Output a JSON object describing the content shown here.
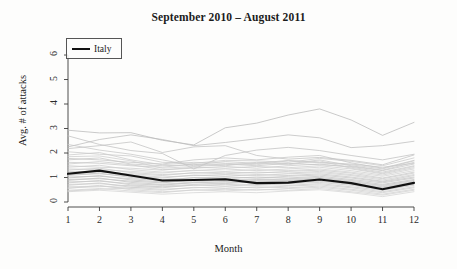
{
  "chart_data": {
    "type": "line",
    "title": "September 2010 – August 2011",
    "xlabel": "Month",
    "ylabel": "Avg. # of attacks",
    "x": [
      1,
      2,
      3,
      4,
      5,
      6,
      7,
      8,
      9,
      10,
      11,
      12
    ],
    "xticklabels": [
      "1",
      "2",
      "3",
      "4",
      "5",
      "6",
      "7",
      "8",
      "9",
      "10",
      "11",
      "12"
    ],
    "yticklabels": [
      "0",
      "1",
      "2",
      "3",
      "4",
      "5",
      "6"
    ],
    "yticks": [
      0,
      1,
      2,
      3,
      4,
      5,
      6
    ],
    "xlim": [
      1,
      12
    ],
    "ylim": [
      0,
      6.45
    ],
    "grid": false,
    "legend": {
      "position": "top-left",
      "entries": [
        {
          "label": "Italy",
          "color": "#111111",
          "linewidth": 2.2
        }
      ]
    },
    "highlight_color": "#111111",
    "background_color": "#fdfdfc",
    "series": [
      {
        "name": "Italy",
        "highlight": true,
        "color": "#111111",
        "values": [
          1.15,
          1.28,
          1.08,
          0.88,
          0.9,
          0.93,
          0.77,
          0.79,
          0.92,
          0.77,
          0.52,
          0.78
        ]
      },
      {
        "name": "country-01",
        "color": "#b8b8b8",
        "values": [
          2.93,
          2.82,
          2.83,
          2.52,
          2.33,
          3.03,
          3.22,
          3.55,
          3.8,
          3.35,
          2.72,
          3.25
        ]
      },
      {
        "name": "country-02",
        "color": "#bcbcbc",
        "values": [
          2.25,
          2.55,
          2.74,
          2.55,
          2.3,
          2.43,
          2.58,
          2.74,
          2.62,
          2.22,
          2.3,
          2.48
        ]
      },
      {
        "name": "country-03",
        "color": "#c0c0c0",
        "values": [
          2.7,
          2.35,
          2.1,
          1.98,
          1.35,
          1.9,
          2.12,
          2.23,
          2.1,
          1.9,
          1.72,
          1.95
        ]
      },
      {
        "name": "country-04",
        "color": "#c2c2c2",
        "values": [
          2.18,
          2.3,
          2.45,
          2.02,
          2.25,
          2.3,
          1.9,
          1.75,
          1.82,
          1.7,
          1.52,
          1.92
        ]
      },
      {
        "name": "country-05",
        "color": "#c4c4c4",
        "values": [
          1.78,
          1.72,
          1.62,
          1.55,
          1.72,
          1.8,
          1.72,
          1.83,
          1.9,
          1.6,
          1.38,
          1.7
        ]
      },
      {
        "name": "country-06",
        "color": "#c6c6c6",
        "values": [
          1.72,
          1.8,
          1.55,
          1.48,
          1.52,
          1.65,
          1.58,
          1.7,
          1.62,
          1.55,
          1.42,
          1.58
        ]
      },
      {
        "name": "country-07",
        "color": "#c8c8c8",
        "values": [
          1.62,
          1.58,
          1.48,
          1.42,
          1.55,
          1.48,
          1.62,
          1.55,
          1.72,
          1.48,
          1.3,
          1.62
        ]
      },
      {
        "name": "country-08",
        "color": "#cacaca",
        "values": [
          1.55,
          1.65,
          1.52,
          1.32,
          1.38,
          1.45,
          1.38,
          1.48,
          1.55,
          1.42,
          1.22,
          1.48
        ]
      },
      {
        "name": "country-09",
        "color": "#cccccc",
        "values": [
          1.48,
          1.42,
          1.38,
          1.3,
          1.42,
          1.38,
          1.45,
          1.4,
          1.48,
          1.35,
          1.15,
          1.4
        ]
      },
      {
        "name": "country-10",
        "color": "#cecece",
        "values": [
          1.42,
          1.5,
          1.32,
          1.22,
          1.28,
          1.35,
          1.28,
          1.35,
          1.42,
          1.28,
          1.1,
          1.35
        ]
      },
      {
        "name": "country-11",
        "color": "#d0d0d0",
        "values": [
          1.35,
          1.32,
          1.25,
          1.18,
          1.3,
          1.25,
          1.32,
          1.28,
          1.35,
          1.22,
          1.05,
          1.28
        ]
      },
      {
        "name": "country-12",
        "color": "#c9c9c9",
        "values": [
          1.3,
          1.38,
          1.2,
          1.12,
          1.18,
          1.22,
          1.18,
          1.25,
          1.3,
          1.18,
          0.98,
          1.22
        ]
      },
      {
        "name": "country-13",
        "color": "#cbcbcb",
        "values": [
          1.25,
          1.22,
          1.15,
          1.08,
          1.2,
          1.15,
          1.22,
          1.18,
          1.25,
          1.12,
          0.95,
          1.18
        ]
      },
      {
        "name": "country-14",
        "color": "#cdcdcd",
        "values": [
          1.18,
          1.28,
          1.1,
          1.02,
          1.08,
          1.12,
          1.08,
          1.15,
          1.2,
          1.08,
          0.9,
          1.12
        ]
      },
      {
        "name": "country-15",
        "color": "#c7c7c7",
        "values": [
          1.12,
          1.15,
          1.05,
          0.98,
          1.1,
          1.05,
          1.12,
          1.08,
          1.15,
          1.02,
          0.85,
          1.08
        ]
      },
      {
        "name": "country-16",
        "color": "#c5c5c5",
        "values": [
          1.08,
          1.18,
          1.0,
          0.92,
          0.98,
          1.02,
          0.98,
          1.05,
          1.1,
          0.98,
          0.82,
          1.02
        ]
      },
      {
        "name": "country-17",
        "color": "#c3c3c3",
        "values": [
          1.02,
          1.05,
          0.95,
          0.88,
          1.0,
          0.95,
          1.02,
          0.98,
          1.05,
          0.92,
          0.78,
          0.98
        ]
      },
      {
        "name": "country-18",
        "color": "#c1c1c1",
        "values": [
          0.98,
          1.08,
          0.9,
          0.82,
          0.88,
          0.92,
          0.88,
          0.95,
          1.0,
          0.88,
          0.72,
          0.92
        ]
      },
      {
        "name": "country-19",
        "color": "#bfbfbf",
        "values": [
          0.92,
          0.95,
          0.85,
          0.78,
          0.9,
          0.85,
          0.92,
          0.88,
          0.95,
          0.82,
          0.68,
          0.88
        ]
      },
      {
        "name": "country-20",
        "color": "#c4c4c4",
        "values": [
          0.88,
          0.98,
          0.8,
          0.72,
          0.78,
          0.82,
          0.78,
          0.85,
          0.9,
          0.78,
          0.62,
          0.82
        ]
      },
      {
        "name": "country-21",
        "color": "#c6c6c6",
        "values": [
          0.82,
          0.85,
          0.75,
          0.68,
          0.8,
          0.75,
          0.82,
          0.78,
          0.85,
          0.72,
          0.58,
          0.78
        ]
      },
      {
        "name": "country-22",
        "color": "#c8c8c8",
        "values": [
          0.78,
          0.88,
          0.7,
          0.62,
          0.68,
          0.72,
          0.68,
          0.75,
          0.8,
          0.68,
          0.52,
          0.72
        ]
      },
      {
        "name": "country-23",
        "color": "#cacaca",
        "values": [
          0.72,
          0.75,
          0.65,
          0.58,
          0.7,
          0.65,
          0.72,
          0.68,
          0.75,
          0.62,
          0.48,
          0.68
        ]
      },
      {
        "name": "country-24",
        "color": "#cccccc",
        "values": [
          0.68,
          0.78,
          0.6,
          0.52,
          0.58,
          0.62,
          0.58,
          0.65,
          0.7,
          0.58,
          0.42,
          0.62
        ]
      },
      {
        "name": "country-25",
        "color": "#cecece",
        "values": [
          0.62,
          0.65,
          0.55,
          0.48,
          0.6,
          0.55,
          0.62,
          0.58,
          0.65,
          0.52,
          0.38,
          0.58
        ]
      },
      {
        "name": "country-26",
        "color": "#d0d0d0",
        "values": [
          0.55,
          0.68,
          0.5,
          0.42,
          0.48,
          0.52,
          0.48,
          0.55,
          0.6,
          0.48,
          0.32,
          0.52
        ]
      },
      {
        "name": "country-27",
        "color": "#d2d2d2",
        "values": [
          0.48,
          0.55,
          0.45,
          0.38,
          0.5,
          0.45,
          0.52,
          0.48,
          0.55,
          0.42,
          0.28,
          0.48
        ]
      },
      {
        "name": "country-28",
        "color": "#d4d4d4",
        "values": [
          0.42,
          0.48,
          0.4,
          0.32,
          0.38,
          0.42,
          0.38,
          0.45,
          0.5,
          0.38,
          0.22,
          0.42
        ]
      },
      {
        "name": "country-29",
        "color": "#c9c9c9",
        "values": [
          2.05,
          1.95,
          1.88,
          1.62,
          1.58,
          1.7,
          1.68,
          1.62,
          1.78,
          1.66,
          1.48,
          1.8
        ]
      },
      {
        "name": "country-30",
        "color": "#cbcbcb",
        "values": [
          1.92,
          2.02,
          1.72,
          1.52,
          1.62,
          1.58,
          1.52,
          1.68,
          1.6,
          1.52,
          1.35,
          1.68
        ]
      },
      {
        "name": "country-31",
        "color": "#c7c7c7",
        "values": [
          2.35,
          2.12,
          1.95,
          1.72,
          1.48,
          1.55,
          1.48,
          1.58,
          1.52,
          1.45,
          1.28,
          1.55
        ]
      },
      {
        "name": "country-32",
        "color": "#cdcdcd",
        "values": [
          1.85,
          1.88,
          1.68,
          1.38,
          1.45,
          1.52,
          1.58,
          1.52,
          1.68,
          1.38,
          1.18,
          1.45
        ]
      },
      {
        "name": "country-33",
        "color": "#d1d1d1",
        "values": [
          0.58,
          0.62,
          0.68,
          0.72,
          0.82,
          0.88,
          0.95,
          0.92,
          0.98,
          0.85,
          0.65,
          0.85
        ]
      },
      {
        "name": "country-34",
        "color": "#cfcfcf",
        "values": [
          0.45,
          0.52,
          0.58,
          0.65,
          0.72,
          0.78,
          0.85,
          0.88,
          0.92,
          0.75,
          0.58,
          0.78
        ]
      }
    ]
  }
}
